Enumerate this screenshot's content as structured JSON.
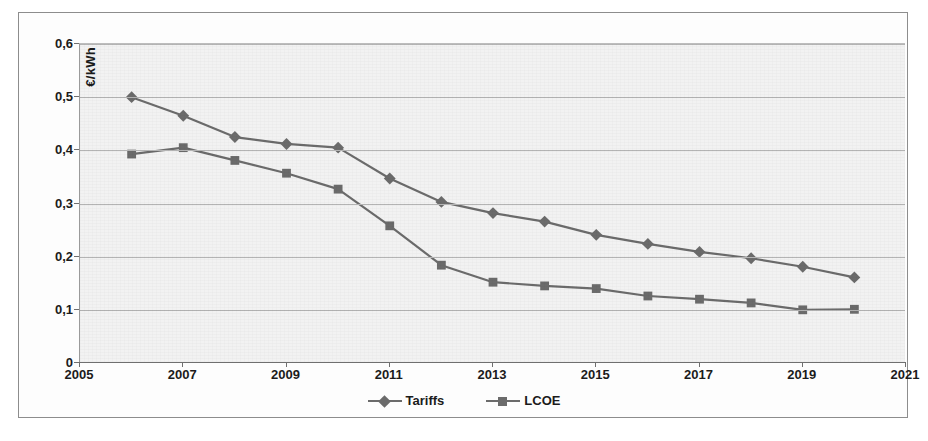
{
  "chart_data": {
    "type": "line",
    "title": "",
    "xlabel": "",
    "ylabel": "€/kWh",
    "xlim": [
      2005,
      2021
    ],
    "ylim": [
      0,
      0.6
    ],
    "grid": true,
    "legend_position": "bottom",
    "decimal_separator": ",",
    "x": [
      2006,
      2007,
      2008,
      2009,
      2010,
      2011,
      2012,
      2013,
      2014,
      2015,
      2016,
      2017,
      2018,
      2019,
      2020
    ],
    "xticks": [
      "2005",
      "2007",
      "2009",
      "2011",
      "2013",
      "2015",
      "2017",
      "2019",
      "2021"
    ],
    "xtick_values": [
      2005,
      2007,
      2009,
      2011,
      2013,
      2015,
      2017,
      2019,
      2021
    ],
    "yticks": [
      "0",
      "0,1",
      "0,2",
      "0,3",
      "0,4",
      "0,5",
      "0,6"
    ],
    "ytick_values": [
      0,
      0.1,
      0.2,
      0.3,
      0.4,
      0.5,
      0.6
    ],
    "series": [
      {
        "name": "Tariffs",
        "marker": "diamond",
        "color": "#6b6b6b",
        "values": [
          0.5,
          0.465,
          0.425,
          0.412,
          0.405,
          0.347,
          0.303,
          0.282,
          0.266,
          0.241,
          0.224,
          0.209,
          0.197,
          0.181,
          0.161
        ]
      },
      {
        "name": "LCOE",
        "marker": "square",
        "color": "#6b6b6b",
        "values": [
          0.393,
          0.405,
          0.381,
          0.357,
          0.327,
          0.258,
          0.184,
          0.152,
          0.145,
          0.14,
          0.126,
          0.12,
          0.113,
          0.1,
          0.101
        ]
      }
    ]
  },
  "legend": {
    "entries": [
      {
        "label": "Tariffs"
      },
      {
        "label": "LCOE"
      }
    ]
  },
  "colors": {
    "line": "#6b6b6b",
    "grid": "#b4b4b4",
    "axis": "#6f6f6f",
    "text": "#1b1b1b",
    "plot_background": "#f2f2f2",
    "frame": "#8d8d8d"
  }
}
